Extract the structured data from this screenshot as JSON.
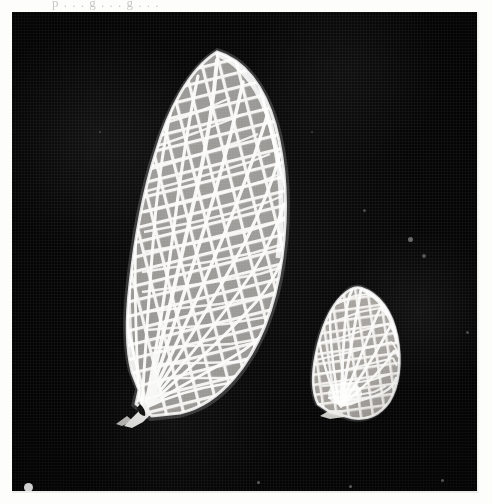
{
  "page": {
    "kind": "scanned-photographic-plate",
    "caption_remnant": "p . . . g . . . g . . .",
    "background_color": "#fdfdfc"
  },
  "plate": {
    "name": "insect-wings-photograph",
    "background_color": "#050505",
    "bounds": {
      "x": 12,
      "y": 12,
      "width": 465,
      "height": 481
    },
    "subjects": [
      {
        "id": "forewing",
        "label": "large wing",
        "description": "elongate forewing with dense reticulate crossvein network, apex upper right, base lower left",
        "color": "#f4f4f2",
        "bounds": {
          "x": 113,
          "y": 40,
          "width": 160,
          "height": 370
        }
      },
      {
        "id": "hindwing",
        "label": "small wing",
        "description": "short rounded hindwing with radiating veins and crossvein cells",
        "color": "#eceae8",
        "bounds": {
          "x": 303,
          "y": 276,
          "width": 85,
          "height": 130
        }
      }
    ],
    "specks": [
      {
        "x": 14,
        "y": 473,
        "r": 4.2,
        "opacity": 0.95
      },
      {
        "x": 398,
        "y": 227,
        "r": 2.6,
        "opacity": 0.45
      },
      {
        "x": 412,
        "y": 243,
        "r": 1.8,
        "opacity": 0.35
      },
      {
        "x": 352,
        "y": 198,
        "r": 1.4,
        "opacity": 0.3
      },
      {
        "x": 246,
        "y": 470,
        "r": 1.6,
        "opacity": 0.4
      },
      {
        "x": 338,
        "y": 474,
        "r": 1.5,
        "opacity": 0.38
      },
      {
        "x": 430,
        "y": 468,
        "r": 1.5,
        "opacity": 0.35
      },
      {
        "x": 88,
        "y": 120,
        "r": 1.2,
        "opacity": 0.25
      },
      {
        "x": 455,
        "y": 320,
        "r": 1.3,
        "opacity": 0.3
      },
      {
        "x": 300,
        "y": 120,
        "r": 1.1,
        "opacity": 0.22
      }
    ]
  }
}
